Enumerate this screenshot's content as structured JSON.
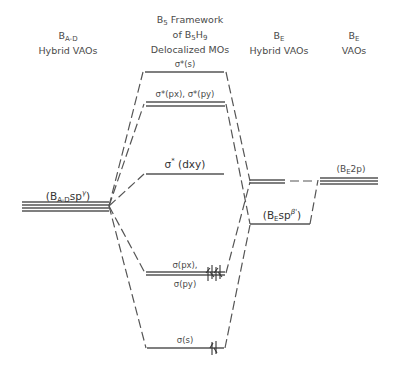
{
  "headers": {
    "col1": {
      "base": "B",
      "sub": "A-D",
      "line2": "Hybrid VAOs"
    },
    "col2": {
      "line1_base": "B",
      "line1_sub": "5",
      "line1_rest": " Framework",
      "line2_pre": "of B",
      "line2_sub1": "5",
      "line2_mid": "H",
      "line2_sub2": "9",
      "line3": "Delocalized MOs"
    },
    "col3": {
      "base": "B",
      "sub": "E",
      "line2": "Hybrid VAOs"
    },
    "col4": {
      "base": "B",
      "sub": "E",
      "line2": "VAOs"
    }
  },
  "levels": {
    "sigma_star_s": "σ*(s)",
    "sigma_star_pxpy": "σ*(px), σ*(py)",
    "sigma_star_dxy_base": "σ",
    "sigma_star_dxy_sup": "*",
    "sigma_star_dxy_rest": " (dxy)",
    "sigma_px": "σ(px),",
    "sigma_py": "σ(py)",
    "sigma_s": "σ(s)",
    "bad_sp_pre": "(B",
    "bad_sp_sub": "A-D",
    "bad_sp_mid": "sp",
    "bad_sp_sup": "γ",
    "bad_sp_post": ")",
    "be_sp_pre": "(B",
    "be_sp_sub": "E",
    "be_sp_mid": "sp",
    "be_sp_sup": "β'",
    "be_sp_post": ")",
    "be_2p_pre": "(B",
    "be_2p_sub": "E",
    "be_2p_post": "2p)"
  },
  "electrons": {
    "sigma_pxpy": "4 electrons (paired)",
    "sigma_s": "2 electrons (paired)"
  }
}
